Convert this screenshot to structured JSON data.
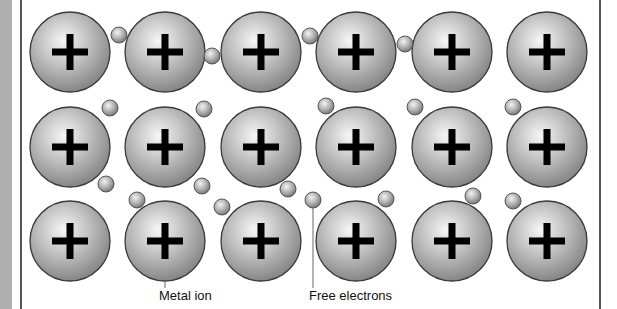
{
  "figure": {
    "ion_symbol": "+",
    "colors": {
      "ion_fill_light": "#f4f4f4",
      "ion_fill_dark": "#8a8a8a",
      "ion_outline": "#3a3a3a",
      "plus_sign": "#000000",
      "electron_fill_light": "#eeeeee",
      "electron_fill_dark": "#7a7a7a",
      "frame_line": "#555555",
      "side_strip": "#b0b0b0"
    },
    "ion_radius": 40,
    "electron_radius": 8,
    "ions": [
      {
        "row": 1,
        "col": 1,
        "x": 70,
        "y": 52
      },
      {
        "row": 1,
        "col": 2,
        "x": 165,
        "y": 52
      },
      {
        "row": 1,
        "col": 3,
        "x": 261,
        "y": 52
      },
      {
        "row": 1,
        "col": 4,
        "x": 356,
        "y": 52
      },
      {
        "row": 1,
        "col": 5,
        "x": 452,
        "y": 52
      },
      {
        "row": 1,
        "col": 6,
        "x": 547,
        "y": 52
      },
      {
        "row": 2,
        "col": 1,
        "x": 70,
        "y": 147
      },
      {
        "row": 2,
        "col": 2,
        "x": 165,
        "y": 147
      },
      {
        "row": 2,
        "col": 3,
        "x": 261,
        "y": 147
      },
      {
        "row": 2,
        "col": 4,
        "x": 356,
        "y": 147
      },
      {
        "row": 2,
        "col": 5,
        "x": 452,
        "y": 147
      },
      {
        "row": 2,
        "col": 6,
        "x": 547,
        "y": 147
      },
      {
        "row": 3,
        "col": 1,
        "x": 70,
        "y": 241
      },
      {
        "row": 3,
        "col": 2,
        "x": 165,
        "y": 241
      },
      {
        "row": 3,
        "col": 3,
        "x": 261,
        "y": 241
      },
      {
        "row": 3,
        "col": 4,
        "x": 356,
        "y": 241
      },
      {
        "row": 3,
        "col": 5,
        "x": 452,
        "y": 241
      },
      {
        "row": 3,
        "col": 6,
        "x": 547,
        "y": 241
      }
    ],
    "electrons": [
      {
        "x": 119,
        "y": 35
      },
      {
        "x": 212,
        "y": 56
      },
      {
        "x": 310,
        "y": 36
      },
      {
        "x": 405,
        "y": 44
      },
      {
        "x": 110,
        "y": 108
      },
      {
        "x": 204,
        "y": 109
      },
      {
        "x": 326,
        "y": 106
      },
      {
        "x": 415,
        "y": 107
      },
      {
        "x": 513,
        "y": 107
      },
      {
        "x": 106,
        "y": 184
      },
      {
        "x": 137,
        "y": 200
      },
      {
        "x": 202,
        "y": 186
      },
      {
        "x": 222,
        "y": 207
      },
      {
        "x": 288,
        "y": 189
      },
      {
        "x": 313,
        "y": 200
      },
      {
        "x": 386,
        "y": 199
      },
      {
        "x": 473,
        "y": 196
      },
      {
        "x": 513,
        "y": 201
      }
    ],
    "labels": {
      "metal_ion": "Metal ion",
      "free_electrons": "Free electrons"
    },
    "leaders": {
      "metal_ion": {
        "x": 165,
        "y1": 281,
        "y2": 288
      },
      "free_electrons": {
        "x": 313,
        "y1": 208,
        "y2": 288
      }
    }
  }
}
